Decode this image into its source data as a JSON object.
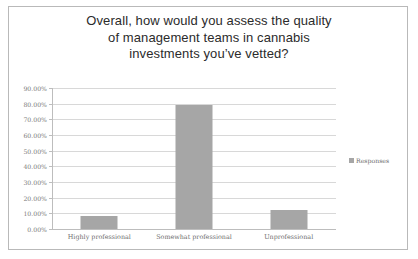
{
  "chart_data": {
    "type": "bar",
    "title_lines": [
      "Overall, how would you assess the quality",
      "of management teams in cannabis",
      "investments you’ve vetted?"
    ],
    "categories": [
      "Highly professional",
      "Somewhat professional",
      "Unprofessional"
    ],
    "values": [
      8.5,
      79.0,
      12.0
    ],
    "series": [
      {
        "name": "Responses",
        "values": [
          8.5,
          79.0,
          12.0
        ]
      }
    ],
    "xlabel": "",
    "ylabel": "",
    "ylim": [
      0,
      90
    ],
    "ytick_step": 10,
    "ytick_labels": [
      "90.00%",
      "80.00%",
      "70.00%",
      "60.00%",
      "50.00%",
      "40.00%",
      "30.00%",
      "20.00%",
      "10.00%",
      "0.00%"
    ],
    "ytick_values": [
      90,
      80,
      70,
      60,
      50,
      40,
      30,
      20,
      10,
      0
    ],
    "grid": true,
    "legend": {
      "position": "right",
      "entries": [
        "Responses"
      ]
    },
    "colors": {
      "bar": "#a6a6a6",
      "gridline": "#d8d8d8",
      "axis": "#bdbdbd",
      "title_text": "#2b2b2b",
      "tick_text": "#7a7a7a",
      "frame_border": "#b9b9b9",
      "background": "#ffffff"
    }
  }
}
